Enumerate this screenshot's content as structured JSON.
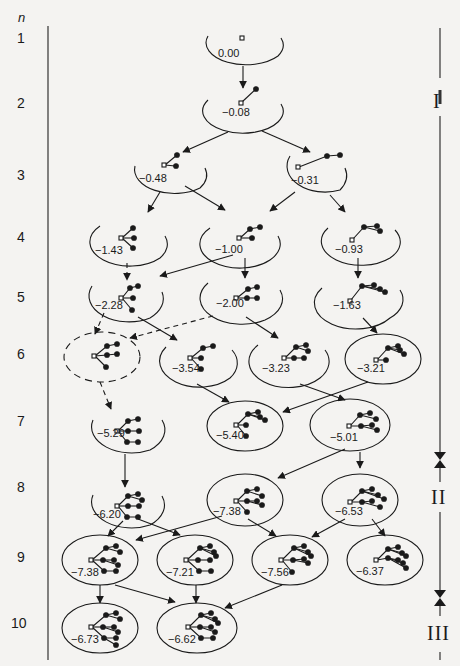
{
  "figure": {
    "axis_label": "n",
    "rows": [
      "1",
      "2",
      "3",
      "4",
      "5",
      "6",
      "7",
      "8",
      "9",
      "10"
    ],
    "phases": [
      {
        "label": "I"
      },
      {
        "label": "II"
      },
      {
        "label": "III"
      }
    ],
    "nodes": [
      {
        "id": "r1a",
        "row": 1,
        "energy": "0.00",
        "shape": "open"
      },
      {
        "id": "r2a",
        "row": 2,
        "energy": "−0.08",
        "shape": "open"
      },
      {
        "id": "r3a",
        "row": 3,
        "energy": "−0.48",
        "shape": "open"
      },
      {
        "id": "r3b",
        "row": 3,
        "energy": "−0.31",
        "shape": "open"
      },
      {
        "id": "r4a",
        "row": 4,
        "energy": "−1.43",
        "shape": "open"
      },
      {
        "id": "r4b",
        "row": 4,
        "energy": "−1.00",
        "shape": "open"
      },
      {
        "id": "r4c",
        "row": 4,
        "energy": "−0.93",
        "shape": "open"
      },
      {
        "id": "r5a",
        "row": 5,
        "energy": "−2.28",
        "shape": "open"
      },
      {
        "id": "r5b",
        "row": 5,
        "energy": "−2.00",
        "shape": "open"
      },
      {
        "id": "r5c",
        "row": 5,
        "energy": "−1.63",
        "shape": "open"
      },
      {
        "id": "r6a",
        "row": 6,
        "energy": "",
        "shape": "dashed"
      },
      {
        "id": "r6b",
        "row": 6,
        "energy": "−3.54",
        "shape": "open"
      },
      {
        "id": "r6c",
        "row": 6,
        "energy": "−3.23",
        "shape": "open"
      },
      {
        "id": "r6d",
        "row": 6,
        "energy": "−3.21",
        "shape": "closed"
      },
      {
        "id": "r7a",
        "row": 7,
        "energy": "−5.29",
        "shape": "open"
      },
      {
        "id": "r7b",
        "row": 7,
        "energy": "−5.40",
        "shape": "closed"
      },
      {
        "id": "r7c",
        "row": 7,
        "energy": "−5.01",
        "shape": "closed"
      },
      {
        "id": "r8a",
        "row": 8,
        "energy": "−6.20",
        "shape": "open"
      },
      {
        "id": "r8b",
        "row": 8,
        "energy": "−7.38",
        "shape": "closed"
      },
      {
        "id": "r8c",
        "row": 8,
        "energy": "−6.53",
        "shape": "closed"
      },
      {
        "id": "r9a",
        "row": 9,
        "energy": "−7.38",
        "shape": "closed"
      },
      {
        "id": "r9b",
        "row": 9,
        "energy": "−7.21",
        "shape": "closed"
      },
      {
        "id": "r9c",
        "row": 9,
        "energy": "−7.56",
        "shape": "closed"
      },
      {
        "id": "r9d",
        "row": 9,
        "energy": "−6.37",
        "shape": "closed"
      },
      {
        "id": "r10a",
        "row": 10,
        "energy": "−6.73",
        "shape": "closed"
      },
      {
        "id": "r10b",
        "row": 10,
        "energy": "−6.62",
        "shape": "closed"
      }
    ],
    "edges": [
      {
        "from": "r1a",
        "to": "r2a",
        "style": "solid"
      },
      {
        "from": "r2a",
        "to": "r3a",
        "style": "solid"
      },
      {
        "from": "r2a",
        "to": "r3b",
        "style": "solid"
      },
      {
        "from": "r3a",
        "to": "r4a",
        "style": "solid"
      },
      {
        "from": "r3a",
        "to": "r4b",
        "style": "solid"
      },
      {
        "from": "r3b",
        "to": "r4b",
        "style": "solid"
      },
      {
        "from": "r3b",
        "to": "r4c",
        "style": "solid"
      },
      {
        "from": "r4a",
        "to": "r5a",
        "style": "dashed"
      },
      {
        "from": "r4b",
        "to": "r5a",
        "style": "solid"
      },
      {
        "from": "r4b",
        "to": "r5b",
        "style": "solid"
      },
      {
        "from": "r4c",
        "to": "r5c",
        "style": "solid"
      },
      {
        "from": "r5a",
        "to": "r6a",
        "style": "dashed"
      },
      {
        "from": "r5b",
        "to": "r6a",
        "style": "dashed"
      },
      {
        "from": "r5a",
        "to": "r6b",
        "style": "solid"
      },
      {
        "from": "r5b",
        "to": "r6c",
        "style": "solid"
      },
      {
        "from": "r5c",
        "to": "r6d",
        "style": "solid"
      },
      {
        "from": "r6a",
        "to": "r7a",
        "style": "dashed"
      },
      {
        "from": "r6b",
        "to": "r7b",
        "style": "solid"
      },
      {
        "from": "r6d",
        "to": "r7b",
        "style": "solid"
      },
      {
        "from": "r6c",
        "to": "r7c",
        "style": "solid"
      },
      {
        "from": "r7a",
        "to": "r8a",
        "style": "solid"
      },
      {
        "from": "r7c",
        "to": "r8b",
        "style": "solid"
      },
      {
        "from": "r7c",
        "to": "r8c",
        "style": "solid"
      },
      {
        "from": "r8a",
        "to": "r9a",
        "style": "solid"
      },
      {
        "from": "r8a",
        "to": "r9b",
        "style": "solid"
      },
      {
        "from": "r8b",
        "to": "r9a",
        "style": "solid"
      },
      {
        "from": "r8b",
        "to": "r9c",
        "style": "solid"
      },
      {
        "from": "r8c",
        "to": "r9c",
        "style": "solid"
      },
      {
        "from": "r8c",
        "to": "r9d",
        "style": "solid"
      },
      {
        "from": "r9a",
        "to": "r10a",
        "style": "solid"
      },
      {
        "from": "r9a",
        "to": "r10b",
        "style": "solid"
      },
      {
        "from": "r9b",
        "to": "r10b",
        "style": "solid"
      },
      {
        "from": "r9c",
        "to": "r10b",
        "style": "solid"
      }
    ]
  }
}
